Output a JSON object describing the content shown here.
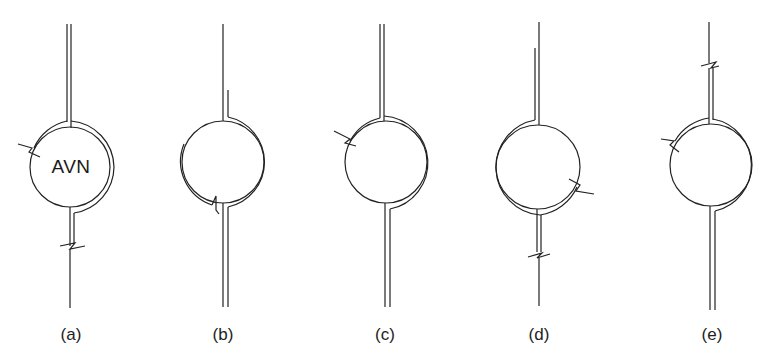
{
  "figure": {
    "node_label": "AVN",
    "line_color": "#222222",
    "background": "#ffffff",
    "panels": [
      {
        "id": "a",
        "label": "(a)",
        "center_x": 70,
        "features": [
          "double line top",
          "outer pathway around right side from left break",
          "break on left upper arc",
          "break on lower stem",
          "single line below break"
        ]
      },
      {
        "id": "b",
        "label": "(b)",
        "center_x": 222,
        "features": [
          "single line top with parallel pathway starting above circle",
          "outer pathway on right side",
          "outer pathway on left side ending with break at bottom",
          "double line bottom"
        ]
      },
      {
        "id": "c",
        "label": "(c)",
        "center_x": 385,
        "features": [
          "double line top",
          "outer pathway on right side",
          "break on left upper arc",
          "double line bottom"
        ]
      },
      {
        "id": "d",
        "label": "(d)",
        "center_x": 538,
        "features": [
          "single line top with parallel pathway",
          "outer pathway around left side",
          "break on right lower arc",
          "break on lower stem",
          "single line below break"
        ]
      },
      {
        "id": "e",
        "label": "(e)",
        "center_x": 712,
        "features": [
          "single line top with break",
          "double line above circle",
          "outer pathway on right side",
          "break on left upper arc",
          "double line bottom"
        ]
      }
    ]
  }
}
